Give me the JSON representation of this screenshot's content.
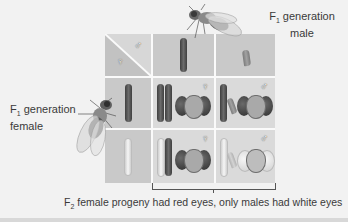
{
  "labels": {
    "male_parent": {
      "prefix": "F",
      "sub": "1",
      "line1": " generation",
      "line2": "male"
    },
    "female_parent": {
      "prefix": "F",
      "sub": "1",
      "line1": " generation",
      "line2": "female"
    },
    "caption": {
      "prefix": "F",
      "sub": "2",
      "text": " female progeny had red eyes, only males had white eyes"
    }
  },
  "grid": {
    "corner": {
      "female_symbol": "♀",
      "male_symbol": "♂"
    },
    "column_headers": [
      {
        "chromosome": "X (red-eye allele)",
        "shade": "dark"
      },
      {
        "chromosome": "Y",
        "shade": "y"
      }
    ],
    "row_headers": [
      {
        "chromosome": "X (red-eye allele)",
        "shade": "dark"
      },
      {
        "chromosome": "X (white-eye allele)",
        "shade": "light"
      }
    ],
    "cells": [
      {
        "row": 0,
        "col": 0,
        "sex_symbol": "♀",
        "eye": "red"
      },
      {
        "row": 0,
        "col": 1,
        "sex_symbol": "♂",
        "eye": "red"
      },
      {
        "row": 1,
        "col": 0,
        "sex_symbol": "♀",
        "eye": "red"
      },
      {
        "row": 1,
        "col": 1,
        "sex_symbol": "♂",
        "eye": "white"
      }
    ]
  },
  "colors": {
    "background": "#f2f2f2",
    "header_cell": "#c9c9c9",
    "content_cell": "#dadada",
    "grid_line": "#fafafa",
    "text": "#3a3a3a"
  }
}
